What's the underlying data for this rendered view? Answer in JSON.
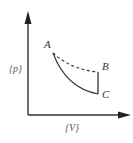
{
  "diagram": {
    "type": "p-V diagram",
    "axes": {
      "y_label": "{p}",
      "x_label": "{V}"
    },
    "points": {
      "A": "A",
      "B": "B",
      "C": "C"
    },
    "paths": [
      {
        "from": "A",
        "to": "B",
        "style": "dashed",
        "shape": "curve"
      },
      {
        "from": "B",
        "to": "C",
        "style": "solid",
        "shape": "vertical line"
      },
      {
        "from": "C",
        "to": "A",
        "style": "solid",
        "shape": "curve"
      }
    ],
    "colors": {
      "line": "#333333",
      "background": "#ffffff"
    }
  }
}
